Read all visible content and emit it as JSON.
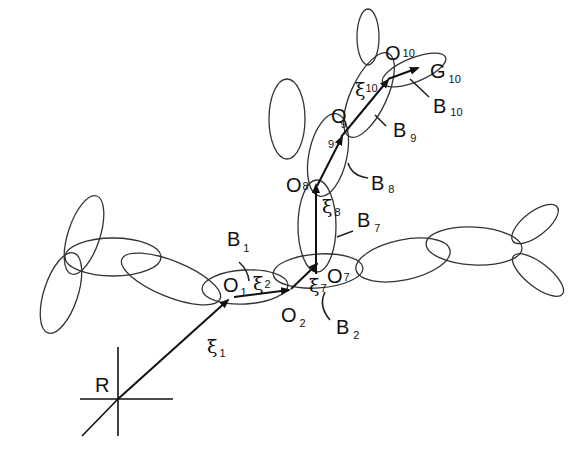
{
  "diagram": {
    "type": "multibody-chain",
    "reference_frame": {
      "label": "R"
    },
    "origins": [
      {
        "id": "O1",
        "main": "O",
        "sub": "1"
      },
      {
        "id": "O2",
        "main": "O",
        "sub": "2"
      },
      {
        "id": "O7",
        "main": "O",
        "sub": "7"
      },
      {
        "id": "O8",
        "main": "O",
        "sub": "8"
      },
      {
        "id": "O9",
        "main": "O",
        "sub": "9"
      },
      {
        "id": "O10",
        "main": "O",
        "sub": "10"
      }
    ],
    "bodies": [
      {
        "id": "B1",
        "main": "B",
        "sub": "1"
      },
      {
        "id": "B2",
        "main": "B",
        "sub": "2"
      },
      {
        "id": "B7",
        "main": "B",
        "sub": "7"
      },
      {
        "id": "B8",
        "main": "B",
        "sub": "8"
      },
      {
        "id": "B9",
        "main": "B",
        "sub": "9"
      },
      {
        "id": "B10",
        "main": "B",
        "sub": "10"
      }
    ],
    "vectors": [
      {
        "id": "xi1",
        "main": "ξ",
        "sub": "1"
      },
      {
        "id": "xi2",
        "main": "ξ",
        "sub": "2"
      },
      {
        "id": "xi7",
        "main": "ξ",
        "sub": "7"
      },
      {
        "id": "xi8",
        "main": "ξ",
        "sub": "8"
      },
      {
        "id": "xi10",
        "main": "ξ",
        "sub": "10"
      }
    ],
    "extra_labels": [
      {
        "id": "sub9_on_O8_link",
        "sub": "9"
      }
    ],
    "end_point": {
      "main": "G",
      "sub": "10"
    }
  }
}
